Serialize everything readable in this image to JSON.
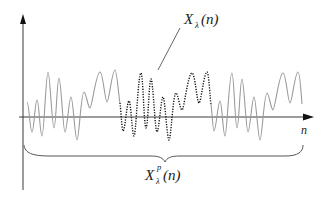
{
  "diagram": {
    "type": "signal-segment-illustration",
    "axes": {
      "x_label": "n",
      "y_label": ""
    },
    "labels": {
      "segment": {
        "symbol": "X",
        "subscript": "λ",
        "superscript": "",
        "arg": "(n)"
      },
      "periodic": {
        "symbol": "X",
        "subscript": "λ",
        "superscript": "p",
        "arg": "(n)"
      }
    },
    "colors": {
      "axis": "#3a3a3a",
      "periodic_wave": "#9a9a9a",
      "segment_wave": "#111111",
      "brace": "#555555",
      "leader": "#555555"
    },
    "waveform": {
      "description": "Grey oscillating signal with a highlighted dotted black segment in the middle; brace spans whole signal",
      "segments": [
        "periodic-left",
        "highlighted-segment",
        "periodic-right"
      ]
    }
  }
}
